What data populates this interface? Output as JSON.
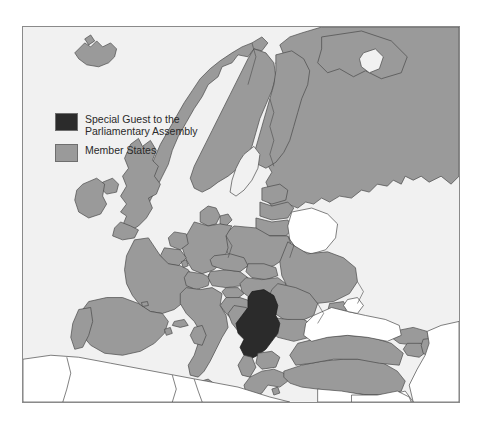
{
  "figure": {
    "kind": "thematic-map",
    "region": "Europe",
    "frame": {
      "border_color": "#8a8a8a",
      "sea_color": "#f1f1f1",
      "background_color": "#ffffff"
    }
  },
  "legend": {
    "position": "top-left",
    "items": [
      {
        "id": "special-guest",
        "label": "Special Guest to the\nParliamentary Assembly",
        "color": "#2b2b2b"
      },
      {
        "id": "member-states",
        "label": "Member States",
        "color": "#9a9a9a"
      }
    ]
  },
  "map_data": {
    "type": "choropleth",
    "categories": [
      "Special Guest to the Parliamentary Assembly",
      "Member States",
      "Not shown"
    ],
    "colors": {
      "special_guest": "#2b2b2b",
      "member_state": "#9a9a9a",
      "non_member": "#ffffff",
      "sea": "#f1f1f1",
      "border": "#4a4a4a"
    },
    "highlighted": [
      "Serbia and Montenegro"
    ],
    "member_states": [
      "Iceland",
      "Norway",
      "Sweden",
      "Finland",
      "Denmark",
      "Estonia",
      "Latvia",
      "Lithuania",
      "Ireland",
      "United Kingdom",
      "Netherlands",
      "Belgium",
      "Luxembourg",
      "France",
      "Portugal",
      "Spain",
      "Andorra",
      "Germany",
      "Poland",
      "Czech Republic",
      "Slovakia",
      "Austria",
      "Switzerland",
      "Liechtenstein",
      "Italy",
      "Slovenia",
      "Croatia",
      "Bosnia and Herzegovina",
      "Hungary",
      "Romania",
      "Bulgaria",
      "Albania",
      "North Macedonia",
      "Greece",
      "Moldova",
      "Ukraine",
      "Russia",
      "Turkey",
      "Cyprus",
      "Malta",
      "Georgia",
      "Armenia",
      "Azerbaijan"
    ],
    "non_member_regions": [
      "Belarus",
      "Morocco",
      "Algeria",
      "Tunisia",
      "Libya",
      "Egypt",
      "Syria",
      "Iraq",
      "Iran",
      "Jordan",
      "Israel",
      "Lebanon",
      "Kazakhstan",
      "Turkmenistan"
    ]
  }
}
